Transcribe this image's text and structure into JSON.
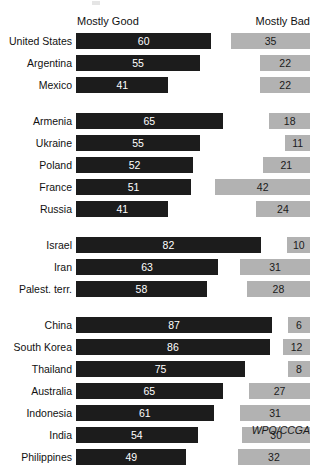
{
  "header": {
    "good_label": "Mostly Good",
    "bad_label": "Mostly Bad"
  },
  "source": "WPO/CCGA",
  "chart_data": {
    "type": "bar",
    "title": "",
    "subtitle": "",
    "xlabel": "",
    "ylabel": "",
    "xlim": [
      0,
      100
    ],
    "grid": false,
    "orientation": "horizontal",
    "legend_position": "top",
    "legend": [
      "Mostly Good",
      "Mostly Bad"
    ],
    "annotations": [
      "WPO/CCGA"
    ],
    "colors": {
      "mostly_good": "#1c1c1c",
      "mostly_bad": "#b2b2b2",
      "background": "#ffffff",
      "text": "#111111"
    },
    "series": [
      {
        "name": "Mostly Good",
        "values": [
          60,
          55,
          41,
          65,
          55,
          52,
          51,
          41,
          82,
          63,
          58,
          87,
          86,
          75,
          65,
          61,
          54,
          49
        ]
      },
      {
        "name": "Mostly Bad",
        "values": [
          35,
          22,
          22,
          18,
          11,
          21,
          42,
          24,
          10,
          31,
          28,
          6,
          12,
          8,
          27,
          31,
          30,
          32
        ]
      }
    ],
    "categories": [
      "United States",
      "Argentina",
      "Mexico",
      "Armenia",
      "Ukraine",
      "Poland",
      "France",
      "Russia",
      "Israel",
      "Iran",
      "Palest. terr.",
      "China",
      "South Korea",
      "Thailand",
      "Australia",
      "Indonesia",
      "India",
      "Philippines"
    ],
    "groups": [
      {
        "name": "americas",
        "rows": [
          {
            "label": "United States",
            "good": 60,
            "bad": 35
          },
          {
            "label": "Argentina",
            "good": 55,
            "bad": 22
          },
          {
            "label": "Mexico",
            "good": 41,
            "bad": 22
          }
        ]
      },
      {
        "name": "europe",
        "rows": [
          {
            "label": "Armenia",
            "good": 65,
            "bad": 18
          },
          {
            "label": "Ukraine",
            "good": 55,
            "bad": 11
          },
          {
            "label": "Poland",
            "good": 52,
            "bad": 21
          },
          {
            "label": "France",
            "good": 51,
            "bad": 42
          },
          {
            "label": "Russia",
            "good": 41,
            "bad": 24
          }
        ]
      },
      {
        "name": "middle-east",
        "rows": [
          {
            "label": "Israel",
            "good": 82,
            "bad": 10
          },
          {
            "label": "Iran",
            "good": 63,
            "bad": 31
          },
          {
            "label": "Palest. terr.",
            "good": 58,
            "bad": 28
          }
        ]
      },
      {
        "name": "asia-pacific",
        "rows": [
          {
            "label": "China",
            "good": 87,
            "bad": 6
          },
          {
            "label": "South Korea",
            "good": 86,
            "bad": 12
          },
          {
            "label": "Thailand",
            "good": 75,
            "bad": 8
          },
          {
            "label": "Australia",
            "good": 65,
            "bad": 27
          },
          {
            "label": "Indonesia",
            "good": 61,
            "bad": 31
          },
          {
            "label": "India",
            "good": 54,
            "bad": 30
          },
          {
            "label": "Philippines",
            "good": 49,
            "bad": 32
          }
        ]
      }
    ]
  }
}
